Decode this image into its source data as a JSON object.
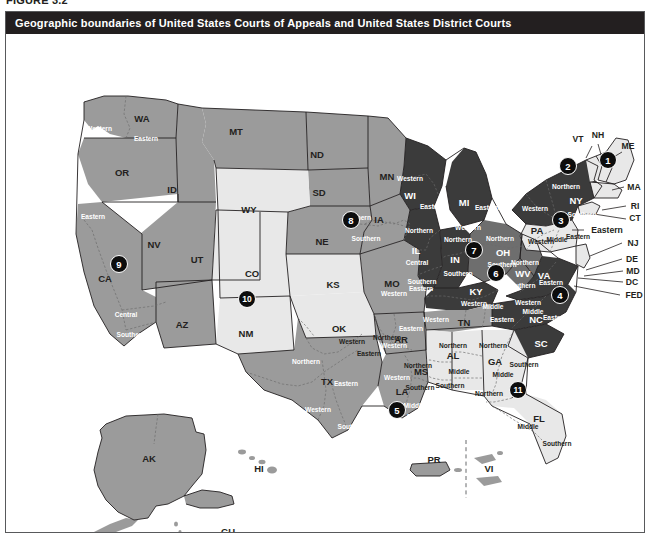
{
  "figure": {
    "label": "FIGURE 3.2"
  },
  "title": {
    "text": "Geographic boundaries of United States Courts of Appeals and United States District Courts"
  },
  "colors": {
    "title_bar_bg": "#231f20",
    "title_bar_fg": "#ffffff",
    "frame_border": "#58595b",
    "circuit_dark": "#3b3b3b",
    "circuit_mid": "#9b9b9b",
    "circuit_mid_dark": "#6e6e6e",
    "circuit_light": "#e8e8e8",
    "badge_bg": "#0d0d0d",
    "badge_fg": "#ffffff"
  },
  "map": {
    "type": "choropleth-boundary-map",
    "circuits": [
      {
        "number": "1",
        "x": 602,
        "y": 126
      },
      {
        "number": "2",
        "x": 562,
        "y": 132
      },
      {
        "number": "3",
        "x": 555,
        "y": 186
      },
      {
        "number": "4",
        "x": 554,
        "y": 261
      },
      {
        "number": "5",
        "x": 391,
        "y": 376
      },
      {
        "number": "6",
        "x": 490,
        "y": 239
      },
      {
        "number": "7",
        "x": 468,
        "y": 216
      },
      {
        "number": "8",
        "x": 345,
        "y": 186
      },
      {
        "number": "9",
        "x": 113,
        "y": 230
      },
      {
        "number": "10",
        "x": 241,
        "y": 265
      },
      {
        "number": "11",
        "x": 512,
        "y": 356
      }
    ],
    "state_labels": [
      {
        "code": "WA",
        "x": 136,
        "y": 84,
        "shade": "mid"
      },
      {
        "code": "MT",
        "x": 230,
        "y": 97,
        "shade": "mid"
      },
      {
        "code": "ND",
        "x": 311,
        "y": 120,
        "shade": "mid"
      },
      {
        "code": "MN",
        "x": 381,
        "y": 142,
        "shade": "mid"
      },
      {
        "code": "OR",
        "x": 116,
        "y": 138,
        "shade": "mid"
      },
      {
        "code": "ID",
        "x": 166,
        "y": 155,
        "shade": "mid"
      },
      {
        "code": "SD",
        "x": 313,
        "y": 158,
        "shade": "mid"
      },
      {
        "code": "WY",
        "x": 243,
        "y": 175,
        "shade": "light"
      },
      {
        "code": "WI",
        "x": 404,
        "y": 161,
        "shade": "dark"
      },
      {
        "code": "MI",
        "x": 458,
        "y": 168,
        "shade": "dark"
      },
      {
        "code": "IA",
        "x": 373,
        "y": 185,
        "shade": "mid"
      },
      {
        "code": "NE",
        "x": 316,
        "y": 207,
        "shade": "mid"
      },
      {
        "code": "NV",
        "x": 148,
        "y": 210,
        "shade": "mid"
      },
      {
        "code": "UT",
        "x": 191,
        "y": 225,
        "shade": "light"
      },
      {
        "code": "IL",
        "x": 410,
        "y": 216,
        "shade": "dark"
      },
      {
        "code": "IN",
        "x": 449,
        "y": 225,
        "shade": "dark"
      },
      {
        "code": "OH",
        "x": 497,
        "y": 218,
        "shade": "midd"
      },
      {
        "code": "PA",
        "x": 531,
        "y": 196,
        "shade": "light"
      },
      {
        "code": "NY",
        "x": 570,
        "y": 166,
        "shade": "dark"
      },
      {
        "code": "CA",
        "x": 99,
        "y": 244,
        "shade": "mid"
      },
      {
        "code": "CO",
        "x": 246,
        "y": 239,
        "shade": "light"
      },
      {
        "code": "KS",
        "x": 327,
        "y": 250,
        "shade": "light"
      },
      {
        "code": "MO",
        "x": 386,
        "y": 249,
        "shade": "mid"
      },
      {
        "code": "KY",
        "x": 470,
        "y": 257,
        "shade": "dark"
      },
      {
        "code": "WV",
        "x": 517,
        "y": 239,
        "shade": "midd"
      },
      {
        "code": "VA",
        "x": 538,
        "y": 241,
        "shade": "dark"
      },
      {
        "code": "AZ",
        "x": 176,
        "y": 290,
        "shade": "mid"
      },
      {
        "code": "NM",
        "x": 240,
        "y": 299,
        "shade": "light"
      },
      {
        "code": "OK",
        "x": 333,
        "y": 294,
        "shade": "light"
      },
      {
        "code": "AR",
        "x": 395,
        "y": 305,
        "shade": "mid"
      },
      {
        "code": "TN",
        "x": 458,
        "y": 288,
        "shade": "mid"
      },
      {
        "code": "NC",
        "x": 530,
        "y": 285,
        "shade": "dark"
      },
      {
        "code": "SC",
        "x": 535,
        "y": 309,
        "shade": "dark"
      },
      {
        "code": "MS",
        "x": 415,
        "y": 337,
        "shade": "light"
      },
      {
        "code": "AL",
        "x": 447,
        "y": 321,
        "shade": "light"
      },
      {
        "code": "GA",
        "x": 489,
        "y": 327,
        "shade": "light"
      },
      {
        "code": "TX",
        "x": 321,
        "y": 347,
        "shade": "mid"
      },
      {
        "code": "LA",
        "x": 396,
        "y": 357,
        "shade": "mid"
      },
      {
        "code": "FL",
        "x": 533,
        "y": 384,
        "shade": "light"
      },
      {
        "code": "AK",
        "x": 143,
        "y": 424,
        "shade": "mid"
      },
      {
        "code": "HI",
        "x": 253,
        "y": 434,
        "shade": "mid"
      },
      {
        "code": "PR",
        "x": 428,
        "y": 425,
        "shade": "mid"
      },
      {
        "code": "VI",
        "x": 483,
        "y": 434,
        "shade": "mid"
      },
      {
        "code": "MP",
        "x": 185,
        "y": 502,
        "shade": "mid"
      },
      {
        "code": "GU",
        "x": 222,
        "y": 497,
        "shade": "mid"
      }
    ],
    "district_labels": [
      {
        "text": "Western",
        "x": 93,
        "y": 94,
        "on": "mid"
      },
      {
        "text": "Eastern",
        "x": 140,
        "y": 104,
        "on": "mid"
      },
      {
        "text": "Northern",
        "x": 51,
        "y": 188,
        "on": "mid"
      },
      {
        "text": "Eastern",
        "x": 87,
        "y": 182,
        "on": "mid"
      },
      {
        "text": "Central",
        "x": 120,
        "y": 280,
        "on": "mid"
      },
      {
        "text": "Southern",
        "x": 125,
        "y": 300,
        "on": "mid"
      },
      {
        "text": "Northern",
        "x": 351,
        "y": 183,
        "on": "mid"
      },
      {
        "text": "Southern",
        "x": 360,
        "y": 204,
        "on": "mid"
      },
      {
        "text": "Western",
        "x": 404,
        "y": 144,
        "on": "dark"
      },
      {
        "text": "Eastern",
        "x": 426,
        "y": 172,
        "on": "dark"
      },
      {
        "text": "Western",
        "x": 462,
        "y": 193,
        "on": "dark"
      },
      {
        "text": "Eastern",
        "x": 481,
        "y": 173,
        "on": "dark"
      },
      {
        "text": "Northern",
        "x": 413,
        "y": 196,
        "on": "dark"
      },
      {
        "text": "Central",
        "x": 411,
        "y": 228,
        "on": "dark"
      },
      {
        "text": "Southern",
        "x": 416,
        "y": 247,
        "on": "dark"
      },
      {
        "text": "Northern",
        "x": 452,
        "y": 205,
        "on": "dark"
      },
      {
        "text": "Southern",
        "x": 452,
        "y": 239,
        "on": "dark"
      },
      {
        "text": "Northern",
        "x": 494,
        "y": 204,
        "on": "midd"
      },
      {
        "text": "Southern",
        "x": 496,
        "y": 230,
        "on": "midd"
      },
      {
        "text": "Northern",
        "x": 519,
        "y": 228,
        "on": "midd"
      },
      {
        "text": "Southern",
        "x": 515,
        "y": 251,
        "on": "midd"
      },
      {
        "text": "Western",
        "x": 535,
        "y": 207,
        "on": "light"
      },
      {
        "text": "Middle",
        "x": 551,
        "y": 205,
        "on": "light"
      },
      {
        "text": "Eastern",
        "x": 572,
        "y": 202,
        "on": "light"
      },
      {
        "text": "Northern",
        "x": 560,
        "y": 152,
        "on": "dark"
      },
      {
        "text": "Western",
        "x": 529,
        "y": 174,
        "on": "dark"
      },
      {
        "text": "Southern",
        "x": 576,
        "y": 180,
        "on": "dark"
      },
      {
        "text": "Western",
        "x": 388,
        "y": 259,
        "on": "mid"
      },
      {
        "text": "Eastern",
        "x": 415,
        "y": 254,
        "on": "mid"
      },
      {
        "text": "Eastern",
        "x": 405,
        "y": 294,
        "on": "mid"
      },
      {
        "text": "Western",
        "x": 388,
        "y": 311,
        "on": "mid"
      },
      {
        "text": "Western",
        "x": 430,
        "y": 285,
        "on": "mid"
      },
      {
        "text": "Middle",
        "x": 487,
        "y": 272,
        "on": "dark"
      },
      {
        "text": "Eastern",
        "x": 496,
        "y": 285,
        "on": "mid"
      },
      {
        "text": "Western",
        "x": 468,
        "y": 269,
        "on": "dark"
      },
      {
        "text": "Western",
        "x": 522,
        "y": 268,
        "on": "dark"
      },
      {
        "text": "Middle",
        "x": 527,
        "y": 277,
        "on": "dark"
      },
      {
        "text": "Eastern",
        "x": 549,
        "y": 283,
        "on": "dark"
      },
      {
        "text": "Eastern",
        "x": 545,
        "y": 248,
        "on": "dark"
      },
      {
        "text": "Western",
        "x": 346,
        "y": 307,
        "on": "light"
      },
      {
        "text": "Northern",
        "x": 381,
        "y": 303,
        "on": "light"
      },
      {
        "text": "Eastern",
        "x": 363,
        "y": 319,
        "on": "light"
      },
      {
        "text": "Northern",
        "x": 300,
        "y": 327,
        "on": "mid"
      },
      {
        "text": "Eastern",
        "x": 340,
        "y": 349,
        "on": "mid"
      },
      {
        "text": "Western",
        "x": 312,
        "y": 375,
        "on": "mid"
      },
      {
        "text": "Southern",
        "x": 346,
        "y": 392,
        "on": "mid"
      },
      {
        "text": "Western",
        "x": 391,
        "y": 343,
        "on": "mid"
      },
      {
        "text": "Middle",
        "x": 408,
        "y": 371,
        "on": "mid"
      },
      {
        "text": "Eastern",
        "x": 413,
        "y": 382,
        "on": "mid"
      },
      {
        "text": "Northern",
        "x": 412,
        "y": 331,
        "on": "light"
      },
      {
        "text": "Southern",
        "x": 414,
        "y": 353,
        "on": "light"
      },
      {
        "text": "Northern",
        "x": 447,
        "y": 311,
        "on": "light"
      },
      {
        "text": "Middle",
        "x": 453,
        "y": 337,
        "on": "light"
      },
      {
        "text": "Southern",
        "x": 444,
        "y": 351,
        "on": "light"
      },
      {
        "text": "Northern",
        "x": 487,
        "y": 311,
        "on": "light"
      },
      {
        "text": "Middle",
        "x": 497,
        "y": 340,
        "on": "light"
      },
      {
        "text": "Southern",
        "x": 518,
        "y": 330,
        "on": "light"
      },
      {
        "text": "Northern",
        "x": 483,
        "y": 359,
        "on": "light"
      },
      {
        "text": "Middle",
        "x": 522,
        "y": 392,
        "on": "light"
      },
      {
        "text": "Southern",
        "x": 551,
        "y": 409,
        "on": "light"
      }
    ],
    "callout_labels": [
      {
        "text": "VT",
        "x": 572,
        "y": 105
      },
      {
        "text": "NH",
        "x": 592,
        "y": 101
      },
      {
        "text": "ME",
        "x": 622,
        "y": 112
      },
      {
        "text": "MA",
        "x": 628,
        "y": 153
      },
      {
        "text": "RI",
        "x": 629,
        "y": 172
      },
      {
        "text": "CT",
        "x": 629,
        "y": 184
      },
      {
        "text": "NJ",
        "x": 627,
        "y": 209
      },
      {
        "text": "DE",
        "x": 626,
        "y": 225
      },
      {
        "text": "MD",
        "x": 627,
        "y": 237
      },
      {
        "text": "DC",
        "x": 626,
        "y": 248
      },
      {
        "text": "FED",
        "x": 628,
        "y": 261
      },
      {
        "text": "Eastern",
        "x": 601,
        "y": 196
      }
    ]
  }
}
